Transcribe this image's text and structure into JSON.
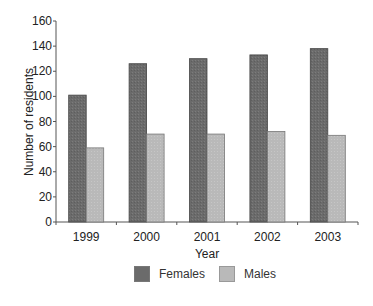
{
  "chart_data": {
    "type": "bar",
    "title": "",
    "xlabel": "Year",
    "ylabel": "Number of residents",
    "categories": [
      "1999",
      "2000",
      "2001",
      "2002",
      "2003"
    ],
    "series": [
      {
        "name": "Females",
        "color": "#6b6b6b",
        "values": [
          101,
          126,
          130,
          133,
          138
        ]
      },
      {
        "name": "Males",
        "color": "#b9b9b9",
        "values": [
          59,
          70,
          70,
          72,
          69
        ]
      }
    ],
    "ylim": [
      0,
      160
    ],
    "yticks": [
      0,
      20,
      40,
      60,
      80,
      100,
      120,
      140,
      160
    ],
    "grid": false,
    "legend_position": "bottom"
  },
  "legend": {
    "items": [
      {
        "label": "Females",
        "color": "#6b6b6b"
      },
      {
        "label": "Males",
        "color": "#b9b9b9"
      }
    ]
  }
}
